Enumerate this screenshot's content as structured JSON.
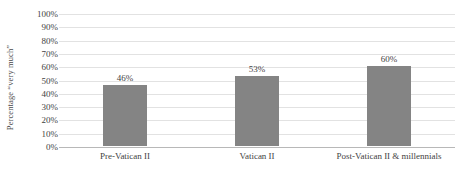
{
  "chart_data": {
    "type": "bar",
    "title": "",
    "subtitle": "",
    "xlabel": "",
    "ylabel": "Percentage “very much”",
    "categories": [
      "Pre-Vatican II",
      "Vatican II",
      "Post-Vatican II & millennials"
    ],
    "values": [
      46,
      53,
      60
    ],
    "data_labels": [
      "46%",
      "53%",
      "60%"
    ],
    "ylim": [
      0,
      100
    ],
    "ytick_values": [
      0,
      10,
      20,
      30,
      40,
      50,
      60,
      70,
      80,
      90,
      100
    ],
    "ytick_labels": [
      "0%",
      "10%",
      "20%",
      "30%",
      "40%",
      "50%",
      "60%",
      "70%",
      "80%",
      "90%",
      "100%"
    ],
    "grid": true,
    "legend": false,
    "legend_position": "none",
    "series": [
      {
        "name": "Percentage “very much”",
        "values": [
          46,
          53,
          60
        ],
        "color": "#848484"
      }
    ],
    "colors": {
      "bar_fill": "#848484",
      "gridline": "#e2e2e2",
      "axis_line": "#b8b8b8",
      "text": "#3f3f3f",
      "background": "#ffffff"
    }
  }
}
